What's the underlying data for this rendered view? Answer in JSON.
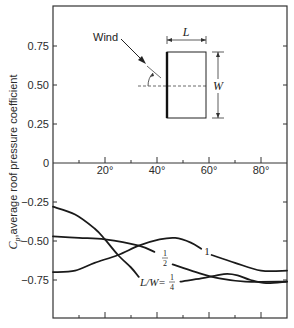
{
  "chart_data": {
    "type": "line",
    "title": "",
    "xlabel": "",
    "ylabel": "C_p, average roof pressure coefficient",
    "ylabel_symbol": "C",
    "ylabel_subscript": "p",
    "ylabel_rest": ",average roof pressure coefficient",
    "xlim": [
      0,
      90
    ],
    "ylim": [
      -1.0,
      1.0
    ],
    "x_ticks": [
      {
        "value": 20,
        "label": "20°"
      },
      {
        "value": 40,
        "label": "40°"
      },
      {
        "value": 60,
        "label": "60°"
      },
      {
        "value": 80,
        "label": "80°"
      }
    ],
    "x_minor_ticks": [
      10,
      30,
      50,
      70
    ],
    "y_ticks": [
      {
        "value": 0.75,
        "label": "0.75"
      },
      {
        "value": 0.5,
        "label": "0.50"
      },
      {
        "value": 0.25,
        "label": "0.25"
      },
      {
        "value": 0,
        "label": "0"
      },
      {
        "value": -0.25,
        "label": "-0.25"
      },
      {
        "value": -0.5,
        "label": "-0.50"
      },
      {
        "value": -0.75,
        "label": "-0.75"
      }
    ],
    "grid": false,
    "series": [
      {
        "name": "L/W = 1/4",
        "label_prefix": "L/W=",
        "label_num": "1",
        "label_den": "4",
        "segments": [
          [
            [
              0,
              -0.28
            ],
            [
              8.5,
              -0.33
            ],
            [
              16,
              -0.42
            ],
            [
              20,
              -0.49
            ],
            [
              25,
              -0.59
            ],
            [
              30,
              -0.67
            ],
            [
              33,
              -0.73
            ]
          ],
          [
            [
              49,
              -0.76
            ],
            [
              57,
              -0.74
            ],
            [
              63,
              -0.72
            ],
            [
              67,
              -0.71
            ],
            [
              71,
              -0.72
            ],
            [
              76,
              -0.75
            ],
            [
              82,
              -0.77
            ],
            [
              90,
              -0.76
            ]
          ]
        ]
      },
      {
        "name": "L/W = 1/2",
        "label_prefix": "",
        "label_num": "1",
        "label_den": "2",
        "segments": [
          [
            [
              0,
              -0.47
            ],
            [
              10,
              -0.48
            ],
            [
              20,
              -0.49
            ],
            [
              33,
              -0.53
            ],
            [
              39,
              -0.57
            ]
          ],
          [
            [
              46,
              -0.65
            ],
            [
              55,
              -0.7
            ],
            [
              64,
              -0.74
            ],
            [
              74,
              -0.76
            ],
            [
              90,
              -0.76
            ]
          ]
        ]
      },
      {
        "name": "L/W = 1",
        "label_prefix": "",
        "label_num": "1",
        "label_den": "",
        "segments": [
          [
            [
              0,
              -0.7
            ],
            [
              8.5,
              -0.69
            ],
            [
              16,
              -0.64
            ],
            [
              25,
              -0.59
            ],
            [
              33,
              -0.53
            ],
            [
              41,
              -0.49
            ],
            [
              47,
              -0.48
            ],
            [
              53,
              -0.51
            ],
            [
              57,
              -0.55
            ]
          ],
          [
            [
              61,
              -0.59
            ],
            [
              70,
              -0.64
            ],
            [
              80,
              -0.69
            ],
            [
              90,
              -0.69
            ]
          ]
        ]
      }
    ],
    "annotations": {
      "inset_wind_label": "Wind",
      "inset_length_label": "L",
      "inset_width_label": "W"
    }
  }
}
